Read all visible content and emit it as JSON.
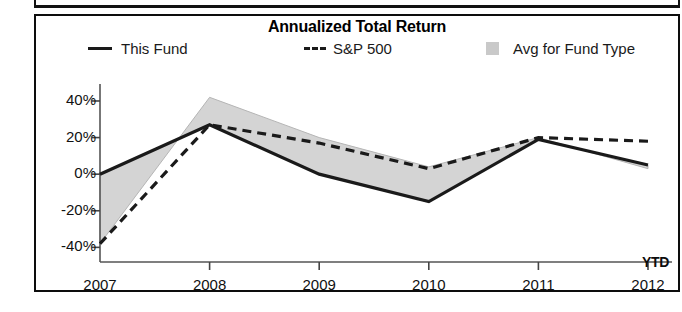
{
  "chart_data": {
    "type": "line",
    "title": "Annualized Total Return",
    "xlabel": "",
    "ylabel": "",
    "grid": false,
    "legend_position": "top",
    "categories": [
      "2007",
      "2008",
      "2009",
      "2010",
      "2011",
      "2012 YTD"
    ],
    "x_tick_labels": [
      "2007",
      "2008",
      "2009",
      "2010",
      "2011",
      "2012"
    ],
    "x_axis_suffix_label": "YTD",
    "y_tick_labels": [
      "40%",
      "20%",
      "0%",
      "-20%",
      "-40%"
    ],
    "y_tick_values": [
      40,
      20,
      0,
      -20,
      -40
    ],
    "ylim": [
      -48,
      46
    ],
    "series": [
      {
        "name": "This Fund",
        "style": "solid",
        "color": "#1a1a1a",
        "values": [
          0,
          27,
          0,
          -15,
          19,
          5
        ]
      },
      {
        "name": "S&P 500",
        "style": "dashed",
        "color": "#1a1a1a",
        "values": [
          -38,
          27,
          17,
          3,
          20,
          18
        ]
      },
      {
        "name": "Avg for Fund Type",
        "style": "area",
        "color": "#cccccc",
        "values": [
          -38,
          42,
          20,
          4,
          20,
          3
        ]
      }
    ]
  },
  "legend": {
    "this_fund": "This Fund",
    "sp500": "S&P 500",
    "avg_fund_type": "Avg for Fund Type"
  }
}
